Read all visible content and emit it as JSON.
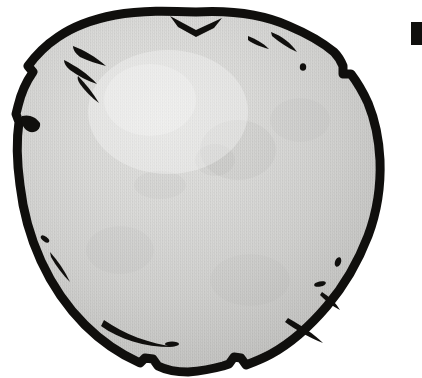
{
  "figure": {
    "kind": "line-art-illustration",
    "subject_label": "stone",
    "background_color": "#ffffff",
    "outline_color": "#100f0d",
    "fill_color_light": "#d8d8d6",
    "fill_color_mid": "#cccccb",
    "fill_color_dark": "#bdbdbb",
    "highlight_color": "#e3e3e1",
    "outline_thickness_px": 9,
    "bounds": {
      "left": 14,
      "top": 10,
      "right": 380,
      "bottom": 372,
      "width": 366,
      "height": 362
    },
    "highlight": {
      "center_x": 175,
      "center_y": 120,
      "radius": 150
    }
  },
  "caption": {
    "glyph_text": "",
    "glyph_description": "bold vertical stroke of a letter cropped at the right page edge",
    "glyph_color": "#100f0d",
    "glyph_x": 411,
    "glyph_y": 22,
    "glyph_width": 11,
    "glyph_height": 23
  },
  "chip_marks": {
    "count": 14,
    "color": "#100f0d",
    "description": "angular chisel-like chips and speckles along the inner rim of the stone"
  }
}
